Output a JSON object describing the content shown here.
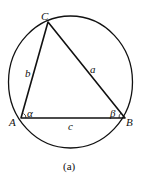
{
  "diagram": {
    "vertices": {
      "A": "A",
      "B": "B",
      "C": "C"
    },
    "sides": {
      "a": "a",
      "b": "b",
      "c": "c"
    },
    "angles": {
      "alpha": "α",
      "beta": "β"
    },
    "caption": "(a)"
  }
}
